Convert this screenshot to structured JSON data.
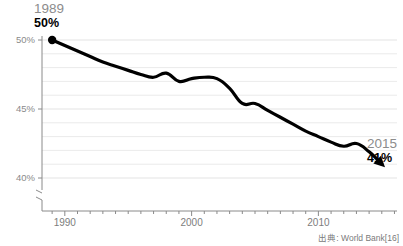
{
  "chart_data": {
    "type": "line",
    "title": "",
    "xlabel": "",
    "ylabel": "",
    "xlim": [
      1988.2,
      2016.2
    ],
    "ylim": [
      39.0,
      50.6
    ],
    "grid": true,
    "legend": "none",
    "y_axis_break": true,
    "y_tick_labels": [
      "50%",
      "45%",
      "40%"
    ],
    "y_ticks": [
      50,
      45,
      40
    ],
    "x_tick_labels": [
      "1990",
      "2000",
      "2010"
    ],
    "x_ticks": [
      1990,
      2000,
      2010
    ],
    "x_minor_tick_interval": 1,
    "series": [
      {
        "name": "labor force participation",
        "color": "#000000",
        "x": [
          1989,
          1990,
          1991,
          1992,
          1993,
          1994,
          1995,
          1996,
          1997,
          1998,
          1999,
          2000,
          2001,
          2002,
          2003,
          2004,
          2005,
          2006,
          2007,
          2008,
          2009,
          2010,
          2011,
          2012,
          2013,
          2014,
          2015
        ],
        "values": [
          50.0,
          49.6,
          49.2,
          48.8,
          48.4,
          48.1,
          47.8,
          47.5,
          47.3,
          47.6,
          47.0,
          47.2,
          47.3,
          47.2,
          46.5,
          45.4,
          45.4,
          44.9,
          44.4,
          43.9,
          43.4,
          43.0,
          42.6,
          42.3,
          42.5,
          41.9,
          41.0
        ]
      }
    ],
    "annotations": [
      {
        "name": "start",
        "year": "1989",
        "value": "50%",
        "marker": "dot"
      },
      {
        "name": "end",
        "year": "2015",
        "value": "41%",
        "marker": "arrow"
      }
    ],
    "caption": "出典: World Bank[16]"
  },
  "colors": {
    "line": "#000000",
    "grid": "#e3e3e3",
    "axis": "#8a8a8a",
    "tick_text": "#8a8a8a",
    "annotation_year": "#8c8c8c",
    "annotation_value": "#000000",
    "background": "#ffffff"
  },
  "axis": {
    "y_labels": [
      {
        "text": "50%"
      },
      {
        "text": "45%"
      },
      {
        "text": "40%"
      }
    ],
    "x_labels": [
      {
        "text": "1990"
      },
      {
        "text": "2000"
      },
      {
        "text": "2010"
      }
    ]
  },
  "annotation_start": {
    "year": "1989",
    "value": "50%"
  },
  "annotation_end": {
    "year": "2015",
    "value": "41%"
  },
  "caption": {
    "text": "出典: World Bank[16]"
  }
}
